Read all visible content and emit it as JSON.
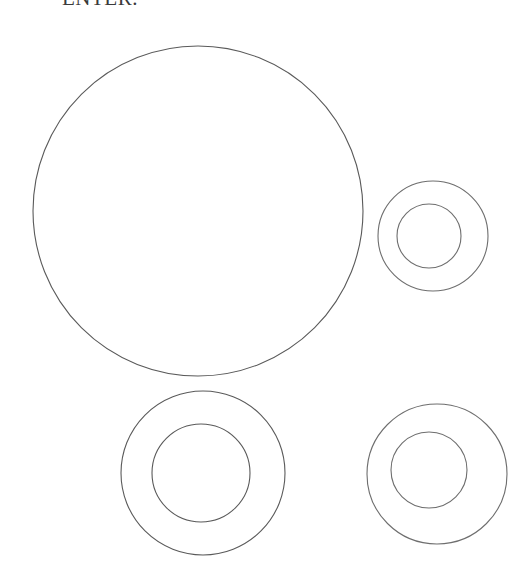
{
  "page": {
    "width": 516,
    "height": 586,
    "background_color": "#ffffff"
  },
  "caption": {
    "text_fragment": "ENTER.",
    "note": "clipped at top edge of scan, only lower half of glyphs visible"
  },
  "style": {
    "stroke_color": "#5a5a5a",
    "stroke_color_light": "#6e6e6e",
    "stroke_width": 1.1,
    "fill": "none"
  },
  "figure": {
    "shapes": [
      {
        "name": "large-circle",
        "kind": "circle",
        "cx": 198,
        "cy": 211,
        "r": 165,
        "stroke": "#5a5a5a"
      },
      {
        "name": "right-annulus-outer",
        "kind": "circle",
        "cx": 433,
        "cy": 236,
        "r": 55,
        "stroke": "#6e6e6e"
      },
      {
        "name": "right-annulus-inner",
        "kind": "circle",
        "cx": 429,
        "cy": 236,
        "r": 32,
        "stroke": "#6e6e6e"
      },
      {
        "name": "bottom-left-annulus-outer",
        "kind": "circle",
        "cx": 203,
        "cy": 473,
        "r": 82,
        "stroke": "#5a5a5a"
      },
      {
        "name": "bottom-left-annulus-inner",
        "kind": "circle",
        "cx": 201,
        "cy": 473,
        "r": 49,
        "stroke": "#5a5a5a"
      },
      {
        "name": "bottom-right-annulus-outer",
        "kind": "circle",
        "cx": 437,
        "cy": 474,
        "r": 70,
        "stroke": "#6e6e6e"
      },
      {
        "name": "bottom-right-annulus-inner",
        "kind": "circle",
        "cx": 429,
        "cy": 470,
        "r": 38,
        "stroke": "#6e6e6e"
      }
    ]
  }
}
